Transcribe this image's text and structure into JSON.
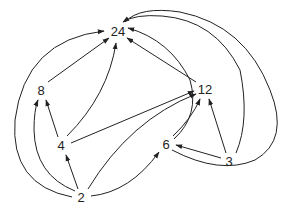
{
  "diagram": {
    "type": "directed-graph",
    "nodes": [
      {
        "id": "24",
        "label": "24",
        "x": 118,
        "y": 31
      },
      {
        "id": "8",
        "label": "8",
        "x": 41,
        "y": 90
      },
      {
        "id": "12",
        "label": "12",
        "x": 205,
        "y": 89
      },
      {
        "id": "4",
        "label": "4",
        "x": 61,
        "y": 145
      },
      {
        "id": "6",
        "label": "6",
        "x": 166,
        "y": 144
      },
      {
        "id": "3",
        "label": "3",
        "x": 229,
        "y": 161
      },
      {
        "id": "2",
        "label": "2",
        "x": 81,
        "y": 197
      }
    ],
    "edges": [
      {
        "from": "8",
        "to": "24"
      },
      {
        "from": "4",
        "to": "24"
      },
      {
        "from": "12",
        "to": "24"
      },
      {
        "from": "2",
        "to": "24"
      },
      {
        "from": "6",
        "to": "24"
      },
      {
        "from": "3",
        "to": "24"
      },
      {
        "from": "4",
        "to": "8"
      },
      {
        "from": "2",
        "to": "8"
      },
      {
        "from": "4",
        "to": "12"
      },
      {
        "from": "2",
        "to": "12"
      },
      {
        "from": "6",
        "to": "12"
      },
      {
        "from": "3",
        "to": "12"
      },
      {
        "from": "2",
        "to": "4"
      },
      {
        "from": "2",
        "to": "6"
      },
      {
        "from": "3",
        "to": "6"
      }
    ]
  }
}
